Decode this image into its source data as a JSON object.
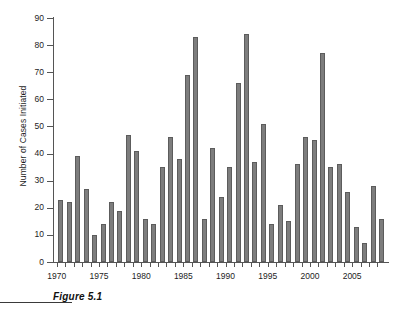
{
  "figure": {
    "caption": "Figure 5.1"
  },
  "chart_data": {
    "type": "bar",
    "title": "",
    "xlabel": "",
    "ylabel": "Number of Cases Initiated",
    "ylim": [
      0,
      90
    ],
    "ytick_step": 10,
    "yticks": [
      0,
      10,
      20,
      30,
      40,
      50,
      60,
      70,
      80,
      90
    ],
    "xlim": [
      1969,
      2009
    ],
    "xtick_labels": [
      "1970",
      "1975",
      "1980",
      "1985",
      "1990",
      "1995",
      "2000",
      "2005"
    ],
    "xtick_label_years": [
      1970,
      1975,
      1980,
      1985,
      1990,
      1995,
      2000,
      2005
    ],
    "grid": false,
    "legend": false,
    "bar_color": "#7d7d7d",
    "bar_edge_color": "#5c5c5c",
    "axis_color": "#555555",
    "categories": [
      1970,
      1971,
      1972,
      1973,
      1974,
      1975,
      1976,
      1977,
      1978,
      1979,
      1980,
      1981,
      1982,
      1983,
      1984,
      1985,
      1986,
      1987,
      1988,
      1989,
      1990,
      1991,
      1992,
      1993,
      1994,
      1995,
      1996,
      1997,
      1998,
      1999,
      2000,
      2001,
      2002,
      2003,
      2004,
      2005,
      2006,
      2007,
      2008
    ],
    "values": [
      23,
      22,
      39,
      27,
      10,
      14,
      22,
      19,
      47,
      41,
      16,
      14,
      35,
      46,
      38,
      69,
      83,
      16,
      42,
      24,
      35,
      66,
      84,
      37,
      51,
      14,
      21,
      15,
      36,
      46,
      45,
      77,
      35,
      36,
      26,
      13,
      7,
      28,
      16
    ]
  }
}
